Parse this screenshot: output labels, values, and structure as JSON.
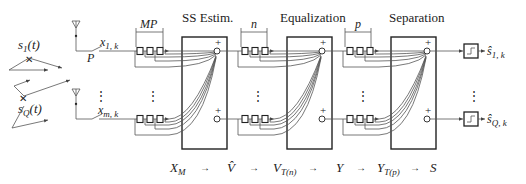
{
  "stages": [
    {
      "id": "ss",
      "title": "SS Estim.",
      "window_label": "MP"
    },
    {
      "id": "eq",
      "title": "Equalization",
      "window_label": "n"
    },
    {
      "id": "sep",
      "title": "Separation",
      "window_label": "p"
    }
  ],
  "sources": [
    {
      "label": "s",
      "sub": "1",
      "arg": "(t)"
    },
    {
      "label": "s",
      "sub": "Q",
      "arg": "(t)"
    }
  ],
  "antennas": [
    {
      "signal": "x",
      "sub": "1, k"
    },
    {
      "signal": "x",
      "sub": "m, k"
    }
  ],
  "sampler_label": "P",
  "summing_sign": "+",
  "outputs": [
    {
      "label": "ŝ",
      "sub": "1, k"
    },
    {
      "label": "ŝ",
      "sub": "Q, k"
    }
  ],
  "flow": {
    "items": [
      {
        "main": "X",
        "sub": "M"
      },
      {
        "main": "V̂",
        "sub": ""
      },
      {
        "main": "V",
        "sub": "T(n)"
      },
      {
        "main": "Y",
        "sub": ""
      },
      {
        "main": "Y",
        "sub": "T(p)"
      },
      {
        "main": "S",
        "sub": ""
      }
    ],
    "arrow": "→"
  },
  "ellipsis": "⋮"
}
